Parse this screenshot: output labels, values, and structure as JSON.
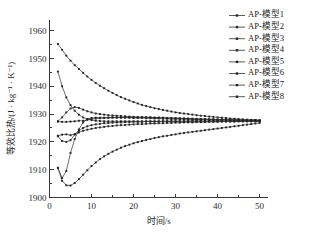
{
  "chart_data": {
    "type": "line",
    "title": "",
    "xlabel": "时间/s",
    "ylabel": "等效比热/(J · kg⁻¹ · K⁻¹)",
    "xlim": [
      0,
      52
    ],
    "ylim": [
      1900,
      1964
    ],
    "xticks": [
      0,
      10,
      20,
      30,
      40,
      50
    ],
    "xtick_labels": [
      "0",
      "10",
      "20",
      "30",
      "40",
      "50"
    ],
    "yticks": [
      1900,
      1910,
      1920,
      1930,
      1940,
      1950,
      1960
    ],
    "ytick_labels": [
      "1900",
      "1910",
      "1920",
      "1930",
      "1940",
      "1950",
      "1960"
    ],
    "grid": false,
    "legend_position": "top-right",
    "marker": "square-dot",
    "line_color": "#2e2e2e",
    "x": [
      2,
      3,
      4,
      5,
      6,
      7,
      8,
      9,
      10,
      11,
      12,
      13,
      14,
      15,
      16,
      17,
      18,
      19,
      20,
      21,
      22,
      23,
      24,
      25,
      26,
      27,
      28,
      29,
      30,
      31,
      32,
      33,
      34,
      35,
      36,
      37,
      38,
      39,
      40,
      41,
      42,
      43,
      44,
      45,
      46,
      47,
      48,
      49,
      50
    ],
    "series": [
      {
        "name": "AP-模型1",
        "values": [
          1955.2,
          1953.1,
          1951.0,
          1949.2,
          1947.6,
          1946.2,
          1944.8,
          1943.5,
          1942.3,
          1941.2,
          1940.2,
          1939.3,
          1938.4,
          1937.6,
          1936.8,
          1936.1,
          1935.5,
          1934.9,
          1934.3,
          1933.8,
          1933.3,
          1932.9,
          1932.5,
          1932.1,
          1931.8,
          1931.5,
          1931.2,
          1930.9,
          1930.6,
          1930.4,
          1930.2,
          1930.0,
          1929.8,
          1929.6,
          1929.4,
          1929.3,
          1929.1,
          1929.0,
          1928.8,
          1928.7,
          1928.6,
          1928.4,
          1928.3,
          1928.2,
          1928.1,
          1928.0,
          1927.9,
          1927.8,
          1927.7
        ]
      },
      {
        "name": "AP-模型2",
        "values": [
          1945.3,
          1940.0,
          1936.0,
          1933.2,
          1931.2,
          1929.8,
          1928.8,
          1928.2,
          1927.8,
          1927.6,
          1927.5,
          1927.4,
          1927.4,
          1927.4,
          1927.4,
          1927.4,
          1927.4,
          1927.4,
          1927.4,
          1927.4,
          1927.4,
          1927.4,
          1927.4,
          1927.4,
          1927.4,
          1927.4,
          1927.4,
          1927.4,
          1927.4,
          1927.4,
          1927.4,
          1927.4,
          1927.4,
          1927.4,
          1927.4,
          1927.4,
          1927.4,
          1927.4,
          1927.4,
          1927.4,
          1927.4,
          1927.4,
          1927.4,
          1927.4,
          1927.4,
          1927.4,
          1927.4,
          1927.4,
          1927.4
        ]
      },
      {
        "name": "AP-模型3",
        "values": [
          1927.4,
          1928.8,
          1930.6,
          1932.0,
          1932.5,
          1932.2,
          1931.6,
          1931.0,
          1930.6,
          1930.2,
          1930.0,
          1929.8,
          1929.6,
          1929.5,
          1929.4,
          1929.3,
          1929.2,
          1929.1,
          1929.0,
          1928.9,
          1928.9,
          1928.8,
          1928.8,
          1928.7,
          1928.7,
          1928.6,
          1928.6,
          1928.5,
          1928.5,
          1928.4,
          1928.4,
          1928.3,
          1928.3,
          1928.2,
          1928.2,
          1928.1,
          1928.1,
          1928.1,
          1928.0,
          1928.0,
          1928.0,
          1927.9,
          1927.9,
          1927.9,
          1927.8,
          1927.8,
          1927.8,
          1927.8,
          1927.7
        ]
      },
      {
        "name": "AP-模型4",
        "values": [
          1927.3,
          1927.2,
          1927.2,
          1927.3,
          1927.4,
          1927.6,
          1927.6,
          1927.9,
          1928.2,
          1928.4,
          1928.5,
          1928.6,
          1928.7,
          1928.7,
          1928.7,
          1928.7,
          1928.7,
          1928.7,
          1928.6,
          1928.6,
          1928.6,
          1928.5,
          1928.5,
          1928.4,
          1928.4,
          1928.3,
          1928.3,
          1928.2,
          1928.2,
          1928.2,
          1928.1,
          1928.1,
          1928.1,
          1928.0,
          1928.0,
          1928.0,
          1927.9,
          1927.9,
          1927.9,
          1927.9,
          1927.8,
          1927.8,
          1927.8,
          1927.8,
          1927.8,
          1927.7,
          1927.7,
          1927.7,
          1927.7
        ]
      },
      {
        "name": "AP-模型5",
        "values": [
          1922.2,
          1922.6,
          1922.7,
          1922.4,
          1922.8,
          1924.0,
          1925.0,
          1925.6,
          1926.0,
          1926.3,
          1926.5,
          1926.7,
          1926.8,
          1926.9,
          1927.0,
          1927.0,
          1927.1,
          1927.1,
          1927.2,
          1927.2,
          1927.2,
          1927.3,
          1927.3,
          1927.3,
          1927.3,
          1927.4,
          1927.4,
          1927.4,
          1927.4,
          1927.4,
          1927.4,
          1927.5,
          1927.5,
          1927.5,
          1927.5,
          1927.5,
          1927.5,
          1927.5,
          1927.6,
          1927.6,
          1927.6,
          1927.6,
          1927.6,
          1927.6,
          1927.6,
          1927.6,
          1927.6,
          1927.6,
          1927.6
        ]
      },
      {
        "name": "AP-模型6",
        "values": [
          1922.0,
          1920.3,
          1920.0,
          1920.6,
          1922.6,
          1923.4,
          1924.0,
          1924.4,
          1924.7,
          1925.0,
          1925.2,
          1925.4,
          1925.6,
          1925.7,
          1925.9,
          1926.0,
          1926.1,
          1926.2,
          1926.3,
          1926.4,
          1926.4,
          1926.5,
          1926.6,
          1926.6,
          1926.7,
          1926.7,
          1926.8,
          1926.8,
          1926.9,
          1926.9,
          1927.0,
          1927.0,
          1927.0,
          1927.1,
          1927.1,
          1927.1,
          1927.2,
          1927.2,
          1927.2,
          1927.3,
          1927.3,
          1927.3,
          1927.3,
          1927.4,
          1927.4,
          1927.4,
          1927.4,
          1927.4,
          1927.4
        ]
      },
      {
        "name": "AP-模型7",
        "values": [
          1910.7,
          1907.0,
          1909.5,
          1916.0,
          1921.0,
          1924.5,
          1927.0,
          1928.2,
          1928.6,
          1928.7,
          1928.7,
          1928.7,
          1928.7,
          1928.8,
          1928.8,
          1928.8,
          1928.8,
          1928.8,
          1928.8,
          1928.8,
          1928.8,
          1928.8,
          1928.8,
          1928.7,
          1928.7,
          1928.7,
          1928.6,
          1928.6,
          1928.5,
          1928.5,
          1928.4,
          1928.4,
          1928.3,
          1928.3,
          1928.2,
          1928.2,
          1928.1,
          1928.1,
          1928.0,
          1928.0,
          1928.0,
          1927.9,
          1927.9,
          1927.9,
          1927.8,
          1927.8,
          1927.8,
          1927.8,
          1927.7
        ]
      },
      {
        "name": "AP-模型8",
        "values": [
          1910.6,
          1906.0,
          1904.4,
          1904.3,
          1905.2,
          1906.6,
          1908.2,
          1909.8,
          1911.3,
          1912.6,
          1913.8,
          1914.8,
          1915.7,
          1916.5,
          1917.2,
          1917.9,
          1918.5,
          1919.0,
          1919.5,
          1919.9,
          1920.3,
          1920.7,
          1921.0,
          1921.4,
          1921.7,
          1922.0,
          1922.2,
          1922.5,
          1922.7,
          1923.0,
          1923.2,
          1923.4,
          1923.6,
          1923.8,
          1924.0,
          1924.2,
          1924.4,
          1924.6,
          1924.8,
          1925.0,
          1925.2,
          1925.4,
          1925.6,
          1925.8,
          1926.0,
          1926.2,
          1926.4,
          1926.6,
          1926.8
        ]
      }
    ]
  },
  "legend": {
    "items": [
      {
        "label": "AP-模型1"
      },
      {
        "label": "AP-模型2"
      },
      {
        "label": "AP-模型3"
      },
      {
        "label": "AP-模型4"
      },
      {
        "label": "AP-模型5"
      },
      {
        "label": "AP-模型6"
      },
      {
        "label": "AP-模型7"
      },
      {
        "label": "AP-模型8"
      }
    ]
  },
  "page": {
    "bleed_text": ""
  }
}
